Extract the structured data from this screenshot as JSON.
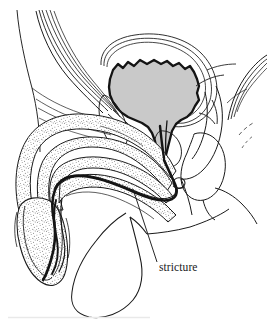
{
  "figure": {
    "kind": "medical-line-diagram",
    "background_color": "#ffffff",
    "ink_color": "#1a1a1a",
    "bladder_fill_color": "#c9c9c9",
    "stipple_color": "#2b2b2b"
  },
  "annotations": {
    "stricture": {
      "label": "stricture",
      "leader_from_x": 133,
      "leader_from_y": 189,
      "leader_to_x": 157,
      "leader_to_y": 262,
      "text_x": 159,
      "text_y": 271
    }
  },
  "structures": [
    {
      "name": "abdominal-wall",
      "style": "multiple-parallel-thin-lines"
    },
    {
      "name": "bladder",
      "style": "gray-filled-scalloped-outline"
    },
    {
      "name": "pubic-symphysis",
      "style": "closed-outline"
    },
    {
      "name": "prostate",
      "style": "outline"
    },
    {
      "name": "penile-shaft-corpus-cavernosum",
      "style": "stippled"
    },
    {
      "name": "corpus-spongiosum-urethra",
      "style": "stippled"
    },
    {
      "name": "glans-penis",
      "style": "stippled"
    },
    {
      "name": "urethra-lumen",
      "style": "thick-dark-line"
    },
    {
      "name": "scrotum",
      "style": "outline"
    },
    {
      "name": "cowpers-gland-loop",
      "style": "small-circle"
    },
    {
      "name": "rectum-anal-canal",
      "style": "outline"
    },
    {
      "name": "sacrum-coccyx",
      "style": "curved-thin-lines"
    },
    {
      "name": "bottom-page-edge",
      "style": "faint-gray-line"
    }
  ]
}
